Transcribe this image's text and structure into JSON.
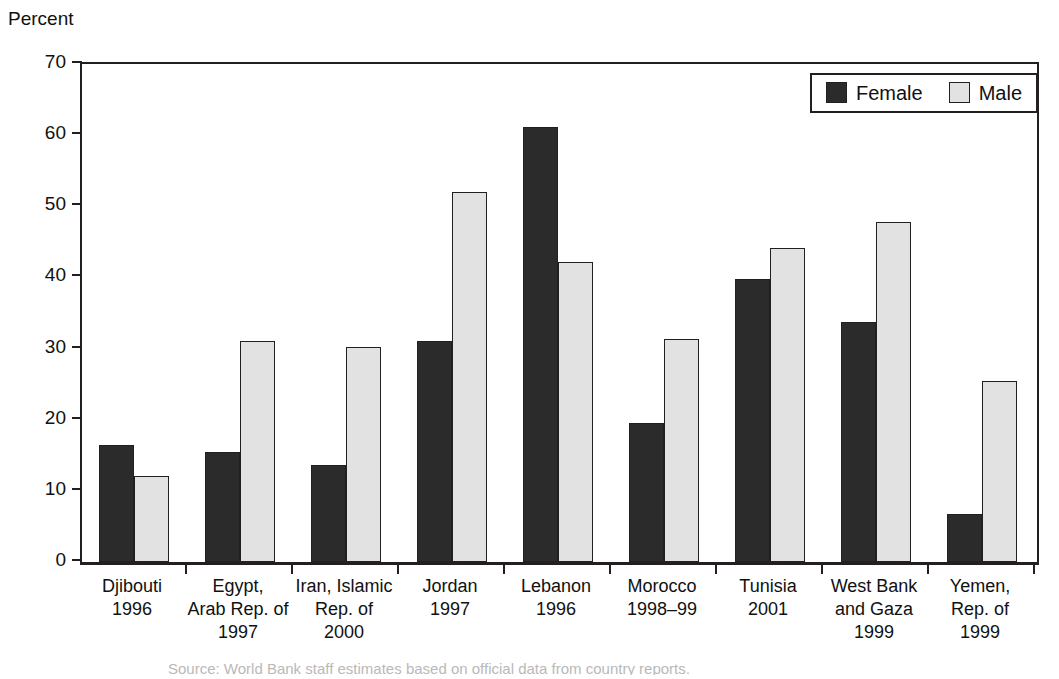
{
  "chart_data": {
    "type": "bar",
    "title": "",
    "ylabel": "Percent",
    "xlabel": "",
    "ylim": [
      0,
      70
    ],
    "yticks": [
      0,
      10,
      20,
      30,
      40,
      50,
      60,
      70
    ],
    "grid": false,
    "legend_position": "top-right",
    "categories": [
      "Djibouti\n1996",
      "Egypt,\nArab Rep. of\n1997",
      "Iran, Islamic\nRep. of\n2000",
      "Jordan\n1997",
      "Lebanon\n1996",
      "Morocco\n1998–99",
      "Tunisia\n2001",
      "West Bank\nand Gaza\n1999",
      "Yemen,\nRep. of\n1999"
    ],
    "category_lines": [
      [
        "Djibouti",
        "1996"
      ],
      [
        "Egypt,",
        "Arab Rep. of",
        "1997"
      ],
      [
        "Iran, Islamic",
        "Rep. of",
        "2000"
      ],
      [
        "Jordan",
        "1997"
      ],
      [
        "Lebanon",
        "1996"
      ],
      [
        "Morocco",
        "1998–99"
      ],
      [
        "Tunisia",
        "2001"
      ],
      [
        "West Bank",
        "and Gaza",
        "1999"
      ],
      [
        "Yemen,",
        "Rep. of",
        "1999"
      ]
    ],
    "series": [
      {
        "name": "Female",
        "color": "#2b2b2b",
        "values": [
          16.4,
          15.4,
          13.7,
          31.0,
          61.1,
          19.5,
          39.8,
          33.8,
          6.8
        ]
      },
      {
        "name": "Male",
        "color": "#e2e2e2",
        "values": [
          12.1,
          31.0,
          30.2,
          52.0,
          42.2,
          31.3,
          44.1,
          47.8,
          25.4
        ]
      }
    ]
  },
  "legend": {
    "entries": [
      {
        "label": "Female"
      },
      {
        "label": "Male"
      }
    ]
  },
  "caption": {
    "text": "Source: World Bank staff estimates based on official data from country reports."
  }
}
